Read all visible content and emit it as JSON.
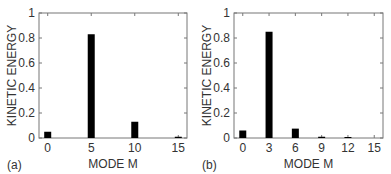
{
  "chart_data": [
    {
      "type": "bar",
      "panel_label": "(a)",
      "title": "",
      "xlabel": "MODE M",
      "ylabel": "KINETIC ENERGY",
      "xlim": [
        -1,
        16
      ],
      "ylim": [
        0,
        1
      ],
      "xticks": [
        0,
        5,
        10,
        15
      ],
      "yticks": [
        0,
        0.2,
        0.4,
        0.6,
        0.8,
        1
      ],
      "ytick_labels": [
        "0",
        "0.2",
        "0.4",
        "0.6",
        "0.8",
        "1"
      ],
      "x": [
        0,
        5,
        10,
        15
      ],
      "values": [
        0.05,
        0.83,
        0.13,
        0.01
      ],
      "bar_color": "#000000",
      "grid": false
    },
    {
      "type": "bar",
      "panel_label": "(b)",
      "title": "",
      "xlabel": "MODE M",
      "ylabel": "KINETIC ENERGY",
      "xlim": [
        -1,
        16
      ],
      "ylim": [
        0,
        1
      ],
      "xticks": [
        0,
        3,
        6,
        9,
        12,
        15
      ],
      "yticks": [
        0,
        0.2,
        0.4,
        0.6,
        0.8,
        1
      ],
      "ytick_labels": [
        "0",
        "0.2",
        "0.4",
        "0.6",
        "0.8",
        "1"
      ],
      "x": [
        0,
        3,
        6,
        9,
        12,
        15
      ],
      "values": [
        0.06,
        0.85,
        0.075,
        0.01,
        0.003,
        0.0
      ],
      "bar_color": "#000000",
      "grid": false
    }
  ]
}
